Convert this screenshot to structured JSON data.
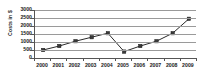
{
  "chart_data": {
    "type": "line",
    "title": "",
    "xlabel": "",
    "ylabel": "Costs in $",
    "categories": [
      "2000",
      "2001",
      "2002",
      "2003",
      "2004",
      "2005",
      "2006",
      "2007",
      "2008",
      "2009"
    ],
    "values": [
      500,
      750,
      1050,
      1300,
      1550,
      400,
      750,
      1050,
      1550,
      2450
    ],
    "series": [
      {
        "name": "Costs",
        "values": [
          500,
          750,
          1050,
          1300,
          1550,
          400,
          750,
          1050,
          1550,
          2450
        ]
      }
    ],
    "ylim": [
      0,
      3000
    ],
    "y_ticks": [
      0,
      500,
      1000,
      1500,
      2000,
      2500,
      3000
    ],
    "y_tick_labels": [
      "0",
      "500",
      "1000",
      "1500",
      "2000",
      "2500",
      "3000"
    ],
    "grid": true,
    "legend": false,
    "legend_position": "none",
    "marker": "square",
    "colors": {
      "line": "#2b2b2b",
      "marker": "#3a3a3a",
      "grid": "#9a9a9a",
      "axis": "#555555",
      "text": "#1a1a1a",
      "background": "#ffffff"
    }
  }
}
